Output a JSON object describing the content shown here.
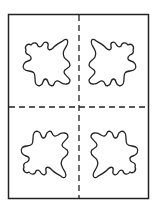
{
  "diagram": {
    "type": "folded-paper-cutout",
    "colors": {
      "background": "#ffffff",
      "stroke": "#222222"
    },
    "sheet": {
      "x": 8,
      "y": 14,
      "width": 141,
      "height": 185
    },
    "fold_lines": {
      "vertical": {
        "x": 79,
        "style": "dashed"
      },
      "horizontal": {
        "y": 107,
        "style": "dashed"
      }
    },
    "quadrants": [
      {
        "position": "top-left",
        "shape": "irregular-blob",
        "orientation": "original"
      },
      {
        "position": "top-right",
        "shape": "irregular-blob",
        "orientation": "mirrored-horizontal"
      },
      {
        "position": "bottom-left",
        "shape": "irregular-blob",
        "orientation": "mirrored-vertical"
      },
      {
        "position": "bottom-right",
        "shape": "irregular-blob",
        "orientation": "mirrored-both"
      }
    ]
  }
}
